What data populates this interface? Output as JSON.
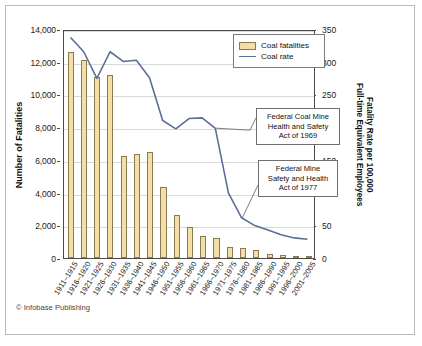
{
  "figure": {
    "footer": "© Infobase Publishing",
    "bar_color": "#f3dfa6",
    "bar_border_color": "#8a7a52",
    "line_color": "#5a6e97",
    "frame_color": "#b9b9b9"
  },
  "legend": {
    "position": "top-right-inside",
    "items": [
      {
        "label": "Coal fatalities",
        "marker": "bar-swatch"
      },
      {
        "label": "Coal rate",
        "marker": "line-swatch"
      }
    ]
  },
  "annotations": [
    {
      "id": "federal-coal-mine-act",
      "lines": [
        "Federal Coal Mine",
        "Health and Safety",
        "Act of 1969"
      ],
      "points_to": "1966–1970"
    },
    {
      "id": "federal-mine-act",
      "lines": [
        "Federal Mine",
        "Safety and Health",
        "Act of 1977"
      ],
      "points_to": "1976–1980"
    }
  ],
  "chart_data": {
    "type": "bar",
    "title": "",
    "xlabel": "",
    "ylabel": "Number of Fatalities",
    "y2label": "Fatality Rate per 100,000 Full-time Equivalent Employees",
    "y2label_lines": [
      "Fatality Rate per 100,000",
      "Full-time Equivalent Employees"
    ],
    "ylim": [
      0,
      14000
    ],
    "y2lim": [
      0,
      350
    ],
    "yticks": [
      0,
      2000,
      4000,
      6000,
      8000,
      10000,
      12000,
      14000
    ],
    "ytick_labels": [
      "0",
      "2,000",
      "4,000",
      "6,000",
      "8,000",
      "10,000",
      "12,000",
      "14,000"
    ],
    "y2ticks": [
      0,
      50,
      100,
      150,
      200,
      250,
      300,
      350
    ],
    "y2tick_labels": [
      "0",
      "50",
      "100",
      "150",
      "200",
      "250",
      "300",
      "350"
    ],
    "grid": true,
    "legend_position": "upper right",
    "categories": [
      "1911–1915",
      "1916–1920",
      "1921–1925",
      "1926–1930",
      "1931–1935",
      "1936–1940",
      "1941–1945",
      "1946–1950",
      "1951–1955",
      "1956–1960",
      "1961–1965",
      "1966–1970",
      "1971–1975",
      "1976–1980",
      "1981–1985",
      "1986–1990",
      "1991–1995",
      "1996–2000",
      "2001–2005"
    ],
    "series": [
      {
        "name": "Coal fatalities",
        "type": "bar",
        "axis": "left",
        "values": [
          12600,
          12100,
          11050,
          11200,
          6250,
          6350,
          6500,
          4350,
          2600,
          1900,
          1330,
          1220,
          660,
          620,
          480,
          250,
          180,
          150,
          110
        ]
      },
      {
        "name": "Coal rate",
        "type": "line",
        "axis": "right",
        "values": [
          340,
          318,
          277,
          318,
          303,
          305,
          278,
          212,
          199,
          215,
          216,
          200,
          100,
          62,
          50,
          43,
          36,
          31,
          29
        ]
      }
    ]
  }
}
